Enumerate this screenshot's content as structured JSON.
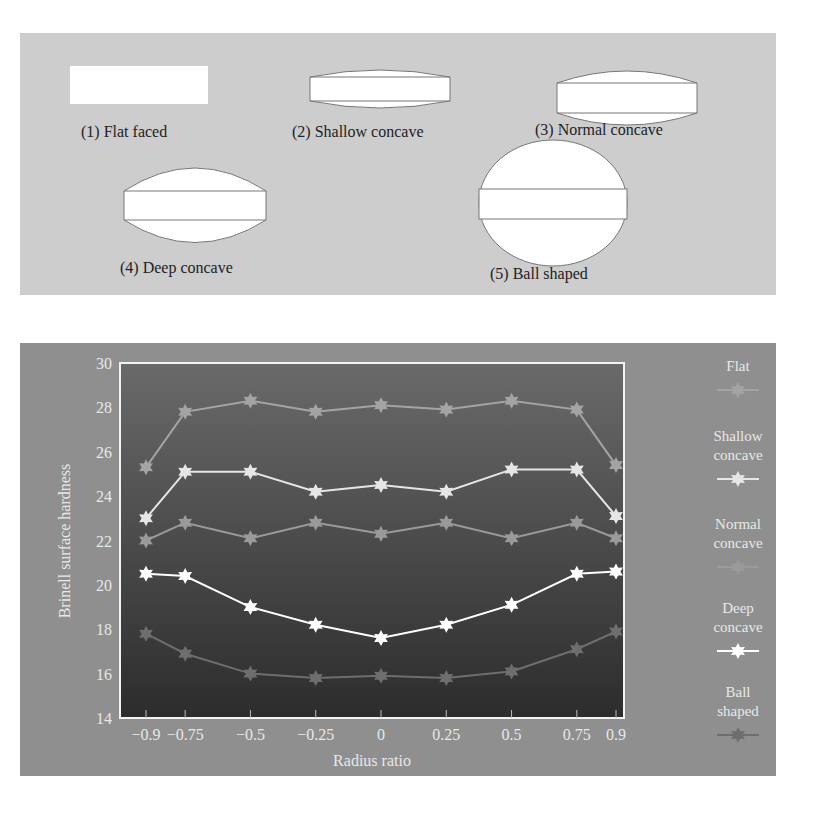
{
  "shapes": [
    {
      "id": 1,
      "label": "(1) Flat faced"
    },
    {
      "id": 2,
      "label": "(2) Shallow concave"
    },
    {
      "id": 3,
      "label": "(3) Normal concave"
    },
    {
      "id": 4,
      "label": "(4) Deep concave"
    },
    {
      "id": 5,
      "label": "(5) Ball shaped"
    }
  ],
  "chart_data": {
    "type": "line",
    "title": "",
    "xlabel": "Radius ratio",
    "ylabel": "Brinell surface hardness",
    "x": [
      -0.9,
      -0.75,
      -0.5,
      -0.25,
      0,
      0.25,
      0.5,
      0.75,
      0.9
    ],
    "x_tick_labels": [
      "−0.9",
      "−0.75",
      "−0.5",
      "−0.25",
      "0",
      "0.25",
      "0.5",
      "0.75",
      "0.9"
    ],
    "y_ticks": [
      14,
      16,
      18,
      20,
      22,
      24,
      26,
      28,
      30
    ],
    "ylim": [
      14,
      30
    ],
    "grid": false,
    "legend_position": "right",
    "series": [
      {
        "name": "Flat",
        "color": "#a4a4a4",
        "values": [
          25.3,
          27.8,
          28.3,
          27.8,
          28.1,
          27.9,
          28.3,
          27.9,
          25.4
        ]
      },
      {
        "name": "Shallow concave",
        "color": "#e6e6e6",
        "values": [
          23.0,
          25.1,
          25.1,
          24.2,
          24.5,
          24.2,
          25.2,
          25.2,
          23.1
        ]
      },
      {
        "name": "Normal concave",
        "color": "#9a9a9a",
        "values": [
          22.0,
          22.8,
          22.1,
          22.8,
          22.3,
          22.8,
          22.1,
          22.8,
          22.1
        ]
      },
      {
        "name": "Deep concave",
        "color": "#ffffff",
        "values": [
          20.5,
          20.4,
          19.0,
          18.2,
          17.6,
          18.2,
          19.1,
          20.5,
          20.6
        ]
      },
      {
        "name": "Ball shaped",
        "color": "#6e6e6e",
        "values": [
          17.8,
          16.9,
          16.0,
          15.8,
          15.9,
          15.8,
          16.1,
          17.1,
          17.9
        ]
      }
    ]
  },
  "legend": [
    {
      "line1": "Flat",
      "line2": ""
    },
    {
      "line1": "Shallow",
      "line2": "concave"
    },
    {
      "line1": "Normal",
      "line2": "concave"
    },
    {
      "line1": "Deep",
      "line2": "concave"
    },
    {
      "line1": "Ball",
      "line2": "shaped"
    }
  ]
}
